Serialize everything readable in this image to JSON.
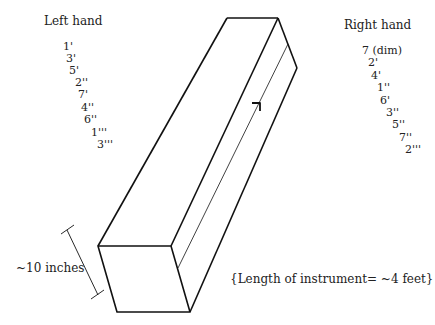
{
  "left_hand": {
    "title": "Left hand",
    "items": [
      "1'",
      "3'",
      "5'",
      "2''",
      "7'",
      "4''",
      "6''",
      "1'''",
      "3'''"
    ]
  },
  "right_hand": {
    "title": "Right hand",
    "items": [
      "7 (dim)",
      "2'",
      "4'",
      "1''",
      "6'",
      "3''",
      "5''",
      "7''",
      "2'''"
    ]
  },
  "dimension_label": "~10 inches",
  "length_note": "{Length of instrument= ~4 feet}",
  "colors": {
    "line": "#111111",
    "text": "#222222",
    "background": "#ffffff"
  }
}
